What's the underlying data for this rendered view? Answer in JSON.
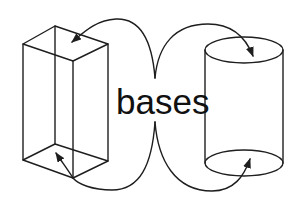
{
  "diagram": {
    "label": "bases",
    "shapes": [
      {
        "name": "rectangular-prism",
        "type": "box"
      },
      {
        "name": "cylinder",
        "type": "cylinder"
      }
    ],
    "arrows": [
      {
        "from": "label",
        "to": "prism-top-base"
      },
      {
        "from": "label",
        "to": "prism-bottom-base"
      },
      {
        "from": "label",
        "to": "cylinder-top-base"
      },
      {
        "from": "label",
        "to": "cylinder-bottom-base"
      }
    ],
    "colors": {
      "stroke": "#1e1e1e",
      "background": "#ffffff"
    }
  }
}
